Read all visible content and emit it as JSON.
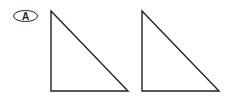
{
  "figure": {
    "label": "A",
    "stroke_color": "#222222",
    "triangles": [
      {
        "id": "left",
        "points": "51,11 51,91 128,91"
      },
      {
        "id": "right",
        "points": "142,11 142,91 219,91"
      }
    ]
  }
}
